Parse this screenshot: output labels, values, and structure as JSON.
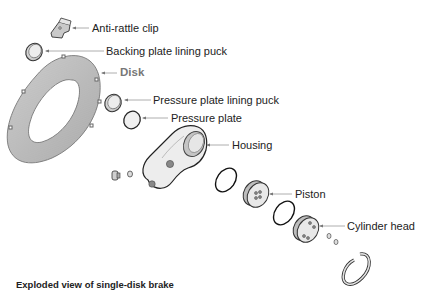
{
  "diagram": {
    "caption": "Exploded view of single-disk brake",
    "labels": {
      "anti_rattle_clip": "Anti-rattle clip",
      "backing_plate_lining_puck": "Backing plate lining puck",
      "disk": "Disk",
      "pressure_plate_lining_puck": "Pressure plate lining puck",
      "pressure_plate": "Pressure plate",
      "housing": "Housing",
      "piston": "Piston",
      "cylinder_head": "Cylinder head"
    },
    "colors": {
      "text": "#222222",
      "disk_label": "#777777",
      "leader_line": "#999999",
      "part_fill": "#d9d9d9",
      "part_outline": "#333333"
    }
  }
}
